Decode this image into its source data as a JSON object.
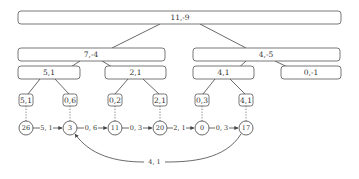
{
  "diagram": {
    "tree": {
      "root": {
        "label": "11,-9"
      },
      "level2": [
        {
          "label": "7,-4"
        },
        {
          "label": "4,-5"
        }
      ],
      "level3": [
        {
          "label": "5,1"
        },
        {
          "label": "2,1"
        },
        {
          "label": "4,1"
        },
        {
          "label": "0,-1"
        }
      ],
      "level4": [
        {
          "label": "5,1"
        },
        {
          "label": "0,6"
        },
        {
          "label": "0,2"
        },
        {
          "label": "2,1"
        },
        {
          "label": "0,3"
        },
        {
          "label": "4,1"
        }
      ]
    },
    "chain": {
      "nodes": [
        {
          "label": "26"
        },
        {
          "label": "3"
        },
        {
          "label": "11"
        },
        {
          "label": "20"
        },
        {
          "label": "0"
        },
        {
          "label": "17"
        }
      ],
      "edges": [
        {
          "from": "26",
          "to": "3",
          "label": "5, 1"
        },
        {
          "from": "3",
          "to": "11",
          "label": "0, 6"
        },
        {
          "from": "11",
          "to": "20",
          "label": "0, 3"
        },
        {
          "from": "20",
          "to": "0",
          "label": "2, 1"
        },
        {
          "from": "0",
          "to": "17",
          "label": "0, 3"
        }
      ],
      "back_edge": {
        "from": "17",
        "to": "3",
        "label": "4, 1"
      }
    }
  }
}
